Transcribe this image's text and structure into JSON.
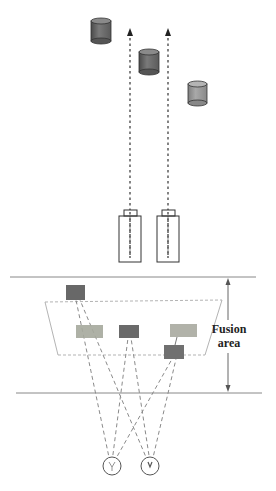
{
  "diagram": {
    "top_section": {
      "description": "Parallel camera configuration with objects",
      "objects": [
        {
          "id": "cylinder-1",
          "cx": 101,
          "cy": 30,
          "color": "#6f6f6f"
        },
        {
          "id": "cylinder-2",
          "cx": 149,
          "cy": 60,
          "color": "#707070"
        },
        {
          "id": "cylinder-3",
          "cx": 197,
          "cy": 92,
          "color": "#9a9a9a"
        }
      ],
      "cameras": [
        {
          "id": "camera-left",
          "x": 130
        },
        {
          "id": "camera-right",
          "x": 168
        }
      ]
    },
    "bottom_section": {
      "fusion_label_line1": "Fusion",
      "fusion_label_line2": "area",
      "squares": [
        {
          "id": "square-top-left",
          "x": 66,
          "y": 285,
          "w": 19,
          "h": 15,
          "color": "#686868"
        },
        {
          "id": "square-mid-left",
          "x": 76,
          "y": 325,
          "w": 27,
          "h": 13,
          "color": "#a5a89c"
        },
        {
          "id": "square-mid-center",
          "x": 119,
          "y": 325,
          "w": 20,
          "h": 13,
          "color": "#6a6a6a"
        },
        {
          "id": "square-mid-right",
          "x": 170,
          "y": 324,
          "w": 27,
          "h": 13,
          "color": "#a8aaa0"
        },
        {
          "id": "square-low-right",
          "x": 164,
          "y": 345,
          "w": 20,
          "h": 14,
          "color": "#707070"
        }
      ],
      "eyes": [
        {
          "id": "eye-left",
          "cx": 112,
          "cy": 466
        },
        {
          "id": "eye-right",
          "cx": 150,
          "cy": 466
        }
      ]
    },
    "colors": {
      "line": "#888888",
      "dash": "#9a9a9a",
      "outline": "#555555"
    }
  }
}
